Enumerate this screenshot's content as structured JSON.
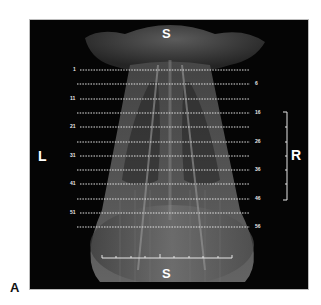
{
  "figure": {
    "panel_label": "A",
    "orientation": {
      "top": "S",
      "bottom": "S",
      "left": "L",
      "right": "R"
    },
    "slice_lines": [
      {
        "label": "1",
        "side": "left",
        "y": 70
      },
      {
        "label": "6",
        "side": "right",
        "y": 84
      },
      {
        "label": "11",
        "side": "left",
        "y": 99
      },
      {
        "label": "16",
        "side": "right",
        "y": 113
      },
      {
        "label": "21",
        "side": "left",
        "y": 127
      },
      {
        "label": "26",
        "side": "right",
        "y": 142
      },
      {
        "label": "31",
        "side": "left",
        "y": 156
      },
      {
        "label": "36",
        "side": "right",
        "y": 170
      },
      {
        "label": "41",
        "side": "left",
        "y": 184
      },
      {
        "label": "46",
        "side": "right",
        "y": 199
      },
      {
        "label": "51",
        "side": "left",
        "y": 213
      },
      {
        "label": "56",
        "side": "right",
        "y": 227
      }
    ],
    "scale_bars": {
      "vertical_ticks": 6,
      "horizontal_ticks": 9
    },
    "colors": {
      "background": "#050505",
      "line": "#e6e6e6",
      "tissue": "#8a8a8a"
    }
  }
}
